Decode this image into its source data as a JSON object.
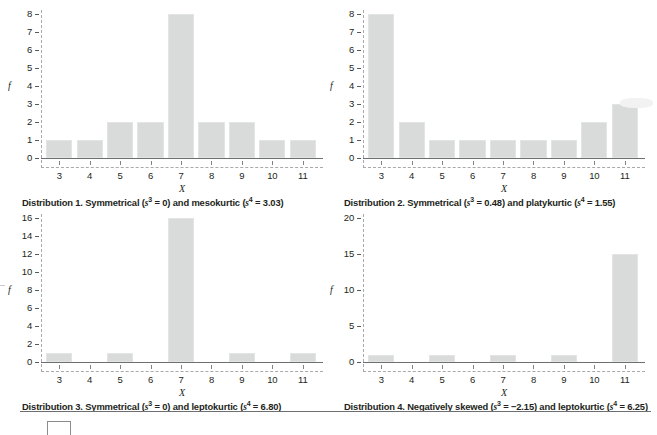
{
  "figure": {
    "bar_color": "#d9dada",
    "axis_color": "#6d6e71",
    "dash_color": "#a7a9ac",
    "text_color": "#231f20"
  },
  "chart_data": [
    {
      "type": "bar",
      "id": "distribution-1",
      "title": "Distribution 1. Symmetrical (s³ = 0) and mesokurtic (s⁴ = 3.03)",
      "caption_parts": {
        "lead": "Distribution 1. Symmetrical (",
        "sym1": "s",
        "sup1": "3",
        "mid": " = 0) and mesokurtic (",
        "sym2": "s",
        "sup2": "4",
        "tail": " = 3.03)"
      },
      "xlabel": "X",
      "ylabel": "f",
      "categories": [
        "3",
        "4",
        "5",
        "6",
        "7",
        "8",
        "9",
        "10",
        "11"
      ],
      "values": [
        1,
        1,
        2,
        2,
        8,
        2,
        2,
        1,
        1
      ],
      "yticks": [
        "0",
        "1",
        "2",
        "3",
        "4",
        "5",
        "6",
        "7",
        "8"
      ],
      "ytick_values": [
        0,
        1,
        2,
        3,
        4,
        5,
        6,
        7,
        8
      ],
      "ylim": [
        0,
        8
      ],
      "grid": false,
      "legend": "none",
      "skewness": "0",
      "kurtosis": "3.03"
    },
    {
      "type": "bar",
      "id": "distribution-2",
      "title": "Distribution 2. Symmetrical (s³ = 0.48) and platykurtic (s⁴ = 1.55)",
      "caption_parts": {
        "lead": "Distribution 2. Symmetrical (",
        "sym1": "s",
        "sup1": "3",
        "mid": " = 0.48) and platykurtic (",
        "sym2": "s",
        "sup2": "4",
        "tail": " = 1.55)"
      },
      "xlabel": "X",
      "ylabel": "f",
      "categories": [
        "3",
        "4",
        "5",
        "6",
        "7",
        "8",
        "9",
        "10",
        "11"
      ],
      "values": [
        8,
        2,
        1,
        1,
        1,
        1,
        1,
        2,
        3
      ],
      "yticks": [
        "0",
        "1",
        "2",
        "3",
        "4",
        "5",
        "6",
        "7",
        "8"
      ],
      "ytick_values": [
        0,
        1,
        2,
        3,
        4,
        5,
        6,
        7,
        8
      ],
      "ylim": [
        0,
        8
      ],
      "grid": false,
      "legend": "none",
      "skewness": "0.48",
      "kurtosis": "1.55"
    },
    {
      "type": "bar",
      "id": "distribution-3",
      "title": "Distribution 3. Symmetrical (s³ = 0) and leptokurtic (s⁴ = 6.80)",
      "caption_parts": {
        "lead": "Distribution 3. Symmetrical (",
        "sym1": "s",
        "sup1": "3",
        "mid": " = 0) and leptokurtic (",
        "sym2": "s",
        "sup2": "4",
        "tail": " = 6.80)"
      },
      "xlabel": "X",
      "ylabel": "f",
      "categories": [
        "3",
        "4",
        "5",
        "6",
        "7",
        "8",
        "9",
        "10",
        "11"
      ],
      "values": [
        1,
        0,
        1,
        0,
        16,
        0,
        1,
        0,
        1
      ],
      "yticks": [
        "0",
        "2",
        "4",
        "6",
        "8",
        "10",
        "12",
        "14",
        "16"
      ],
      "ytick_values": [
        0,
        2,
        4,
        6,
        8,
        10,
        12,
        14,
        16
      ],
      "ylim": [
        0,
        16
      ],
      "grid": false,
      "legend": "none",
      "skewness": "0",
      "kurtosis": "6.80"
    },
    {
      "type": "bar",
      "id": "distribution-4",
      "title": "Distribution 4. Negatively skewed (s³ = −2.15) and leptokurtic (s⁴ = 6.25)",
      "caption_parts": {
        "lead": "Distribution 4. Negatively skewed (",
        "sym1": "s",
        "sup1": "3",
        "mid": " = −2.15) and leptokurtic (",
        "sym2": "s",
        "sup2": "4",
        "tail": " = 6.25)"
      },
      "xlabel": "X",
      "ylabel": "f",
      "categories": [
        "3",
        "4",
        "5",
        "6",
        "7",
        "8",
        "9",
        "10",
        "11"
      ],
      "values": [
        1,
        0,
        1,
        0,
        1,
        0,
        1,
        0,
        15
      ],
      "yticks": [
        "0",
        "5",
        "10",
        "15",
        "20"
      ],
      "ytick_values": [
        0,
        5,
        10,
        15,
        20
      ],
      "ylim": [
        0,
        20
      ],
      "grid": false,
      "legend": "none",
      "skewness": "−2.15",
      "kurtosis": "6.25"
    }
  ]
}
